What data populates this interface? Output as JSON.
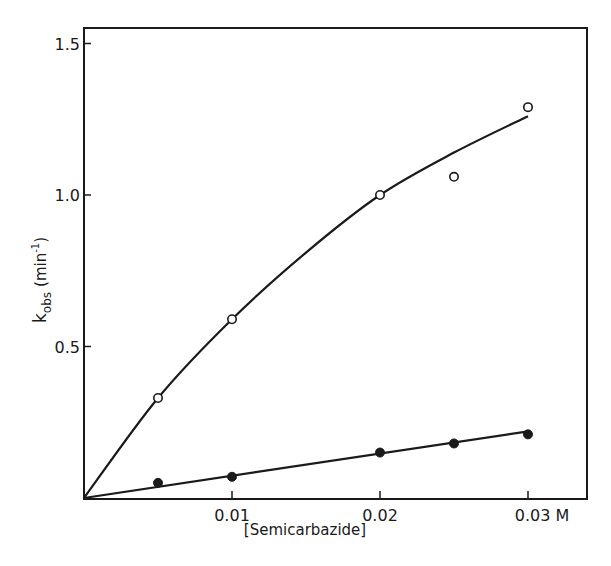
{
  "chart_data": {
    "type": "scatter",
    "title": "",
    "xlabel": "[Semicarbazide]",
    "ylabel": "k_obs (min^-1)",
    "ylabel_parts": {
      "k": "k",
      "sub": "obs",
      "unit_open": "(min",
      "sup": "-1",
      "unit_close": ")"
    },
    "xlim": [
      0,
      0.034
    ],
    "ylim": [
      0,
      1.56
    ],
    "grid": false,
    "legend": null,
    "x_ticks": [
      {
        "value": 0.01,
        "label": "0.01"
      },
      {
        "value": 0.02,
        "label": "0.02"
      },
      {
        "value": 0.03,
        "label": "0.03 M"
      }
    ],
    "y_ticks": [
      {
        "value": 0.5,
        "label": "0.5"
      },
      {
        "value": 1.0,
        "label": "1.0"
      },
      {
        "value": 1.5,
        "label": "1.5"
      }
    ],
    "series": [
      {
        "name": "open circles",
        "marker": "open-circle",
        "x": [
          0.005,
          0.01,
          0.02,
          0.025,
          0.03
        ],
        "values": [
          0.33,
          0.59,
          1.0,
          1.06,
          1.29
        ],
        "fit_curve": {
          "x": [
            0,
            0.005,
            0.01,
            0.015,
            0.02,
            0.025,
            0.03
          ],
          "y": [
            0,
            0.33,
            0.59,
            0.81,
            1.0,
            1.14,
            1.26
          ]
        }
      },
      {
        "name": "filled circles",
        "marker": "filled-circle",
        "x": [
          0.005,
          0.01,
          0.02,
          0.025,
          0.03
        ],
        "values": [
          0.05,
          0.07,
          0.15,
          0.18,
          0.21
        ],
        "fit_line": {
          "x": [
            0,
            0.03
          ],
          "y": [
            0,
            0.22
          ]
        }
      }
    ]
  }
}
